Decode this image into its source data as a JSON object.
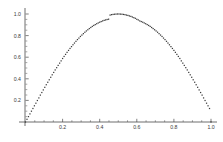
{
  "chart_data": {
    "type": "scatter",
    "title": "",
    "subtitle": "",
    "xlabel": "",
    "ylabel": "",
    "xlim": [
      0.0,
      1.0
    ],
    "ylim": [
      0.0,
      1.0
    ],
    "grid": false,
    "legend": null,
    "marker": "point",
    "marker_color": "#3b3b3b",
    "axis_color": "#4a4a4a",
    "background_color": "#ffffff",
    "xticks": [
      0.2,
      0.4,
      0.6,
      0.8,
      1.0
    ],
    "xtick_labels": [
      "0.2",
      "0.4",
      "0.6",
      "0.8",
      "1.0"
    ],
    "yticks": [
      0.2,
      0.4,
      0.6,
      0.8,
      1.0
    ],
    "ytick_labels": [
      "0.2",
      "0.4",
      "0.6",
      "0.8",
      "1.0"
    ],
    "x_minor_ticks": [
      0.05,
      0.1,
      0.15,
      0.25,
      0.3,
      0.35,
      0.45,
      0.5,
      0.55,
      0.65,
      0.7,
      0.75,
      0.85,
      0.9,
      0.95
    ],
    "y_minor_ticks": [
      0.05,
      0.1,
      0.15,
      0.25,
      0.3,
      0.35,
      0.45,
      0.5,
      0.55,
      0.65,
      0.7,
      0.75,
      0.85,
      0.9,
      0.95
    ],
    "series": [
      {
        "name": "sin(pi x)",
        "x": [
          0.0,
          0.008,
          0.016,
          0.024,
          0.032,
          0.04,
          0.048,
          0.056,
          0.064,
          0.072,
          0.08,
          0.088,
          0.096,
          0.104,
          0.112,
          0.12,
          0.128,
          0.136,
          0.144,
          0.152,
          0.16,
          0.168,
          0.176,
          0.184,
          0.192,
          0.2,
          0.208,
          0.216,
          0.224,
          0.232,
          0.24,
          0.248,
          0.256,
          0.264,
          0.272,
          0.28,
          0.288,
          0.296,
          0.304,
          0.312,
          0.32,
          0.328,
          0.336,
          0.344,
          0.352,
          0.36,
          0.368,
          0.376,
          0.384,
          0.392,
          0.4,
          0.408,
          0.416,
          0.424,
          0.432,
          0.44,
          0.448,
          0.456,
          0.464,
          0.472,
          0.48,
          0.488,
          0.496,
          0.504,
          0.512,
          0.52,
          0.528,
          0.536,
          0.544,
          0.552,
          0.56,
          0.568,
          0.576,
          0.584,
          0.592,
          0.6,
          0.608,
          0.616,
          0.624,
          0.632,
          0.64,
          0.648,
          0.656,
          0.664,
          0.672,
          0.68,
          0.688,
          0.696,
          0.704,
          0.712,
          0.72,
          0.728,
          0.736,
          0.744,
          0.752,
          0.76,
          0.768,
          0.776,
          0.784,
          0.792,
          0.8,
          0.808,
          0.816,
          0.824,
          0.832,
          0.84,
          0.848,
          0.856,
          0.864,
          0.872,
          0.88,
          0.888,
          0.896,
          0.904,
          0.912,
          0.92,
          0.928,
          0.936,
          0.944,
          0.952,
          0.96,
          0.968,
          0.976,
          0.984,
          0.992,
          1.0
        ],
        "y": [
          0.0,
          0.025,
          0.05,
          0.075,
          0.1,
          0.125,
          0.15,
          0.174,
          0.199,
          0.223,
          0.249,
          0.273,
          0.297,
          0.321,
          0.345,
          0.368,
          0.391,
          0.414,
          0.437,
          0.459,
          0.482,
          0.503,
          0.524,
          0.545,
          0.566,
          0.588,
          0.607,
          0.626,
          0.645,
          0.663,
          0.681,
          0.698,
          0.715,
          0.731,
          0.747,
          0.763,
          0.777,
          0.792,
          0.805,
          0.818,
          0.831,
          0.843,
          0.854,
          0.865,
          0.875,
          0.885,
          0.894,
          0.902,
          0.91,
          0.917,
          0.924,
          0.93,
          0.936,
          0.941,
          0.945,
          0.949,
          0.952,
          0.99,
          0.994,
          0.996,
          0.998,
          0.999,
          1.0,
          1.0,
          0.999,
          0.998,
          0.996,
          0.994,
          0.99,
          0.987,
          0.982,
          0.978,
          0.972,
          0.966,
          0.96,
          0.951,
          0.945,
          0.936,
          0.93,
          0.924,
          0.917,
          0.91,
          0.902,
          0.894,
          0.885,
          0.875,
          0.865,
          0.854,
          0.843,
          0.831,
          0.818,
          0.805,
          0.792,
          0.777,
          0.763,
          0.747,
          0.731,
          0.715,
          0.698,
          0.681,
          0.663,
          0.645,
          0.626,
          0.607,
          0.588,
          0.566,
          0.545,
          0.524,
          0.503,
          0.482,
          0.459,
          0.437,
          0.414,
          0.391,
          0.368,
          0.345,
          0.321,
          0.297,
          0.273,
          0.249,
          0.223,
          0.199,
          0.174,
          0.15,
          0.125,
          0.0
        ]
      }
    ]
  }
}
